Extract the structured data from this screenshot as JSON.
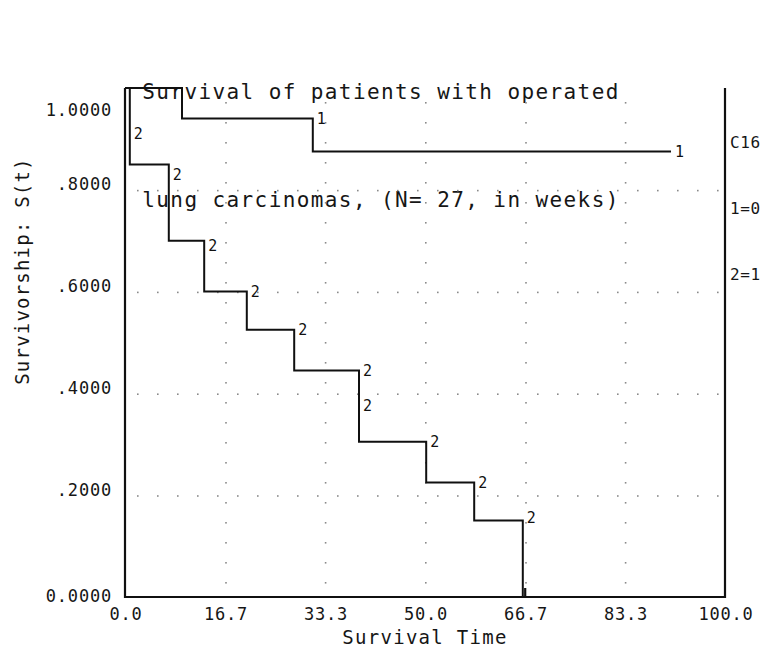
{
  "title": {
    "line1": "Survival of patients with operated",
    "line2": "lung carcinomas, (N= 27, in weeks)"
  },
  "axes": {
    "ylabel": "Survivorship: S(t)",
    "xlabel": "Survival Time",
    "yticks": [
      "1.0000",
      ".8000",
      ".6000",
      ".4000",
      ".2000",
      "0.0000"
    ],
    "xticks": [
      "0.0",
      "16.7",
      "33.3",
      "50.0",
      "66.7",
      "83.3",
      "100.0"
    ]
  },
  "legend": {
    "header": "C16",
    "entry1": "1=0",
    "entry2": "2=1"
  },
  "chart_data": {
    "type": "line",
    "title": "Survival of patients with operated lung carcinomas, (N= 27, in weeks)",
    "xlabel": "Survival Time",
    "ylabel": "Survivorship: S(t)",
    "xlim": [
      0.0,
      100.0
    ],
    "ylim": [
      0.0,
      1.0
    ],
    "xtick_values": [
      0.0,
      16.7,
      33.3,
      50.0,
      66.7,
      83.3,
      100.0
    ],
    "ytick_values": [
      1.0,
      0.8,
      0.6,
      0.4,
      0.2,
      0.0
    ],
    "grid": "dotted",
    "legend_position": "top-right-outside",
    "legend_title": "C16",
    "series": [
      {
        "name": "1=0",
        "marker": "1",
        "step": "post",
        "points": [
          {
            "x": 0.0,
            "y": 1.0
          },
          {
            "x": 9.5,
            "y": 1.0
          },
          {
            "x": 9.5,
            "y": 0.94
          },
          {
            "x": 31.3,
            "y": 0.94
          },
          {
            "x": 31.3,
            "y": 0.875
          },
          {
            "x": 91.0,
            "y": 0.875
          }
        ],
        "marker_points": [
          {
            "x": 31.3,
            "y": 0.94
          },
          {
            "x": 91.0,
            "y": 0.875
          }
        ]
      },
      {
        "name": "2=1",
        "marker": "2",
        "step": "post",
        "points": [
          {
            "x": 0.0,
            "y": 1.0
          },
          {
            "x": 0.8,
            "y": 1.0
          },
          {
            "x": 0.8,
            "y": 0.85
          },
          {
            "x": 7.3,
            "y": 0.85
          },
          {
            "x": 7.3,
            "y": 0.7
          },
          {
            "x": 13.2,
            "y": 0.7
          },
          {
            "x": 13.2,
            "y": 0.6
          },
          {
            "x": 20.3,
            "y": 0.6
          },
          {
            "x": 20.3,
            "y": 0.525
          },
          {
            "x": 28.2,
            "y": 0.525
          },
          {
            "x": 28.2,
            "y": 0.445
          },
          {
            "x": 39.0,
            "y": 0.445
          },
          {
            "x": 39.0,
            "y": 0.305
          },
          {
            "x": 50.2,
            "y": 0.305
          },
          {
            "x": 50.2,
            "y": 0.225
          },
          {
            "x": 58.2,
            "y": 0.225
          },
          {
            "x": 58.2,
            "y": 0.15
          },
          {
            "x": 66.3,
            "y": 0.15
          },
          {
            "x": 66.3,
            "y": 0.0
          }
        ],
        "marker_points": [
          {
            "x": 0.8,
            "y": 0.91
          },
          {
            "x": 7.3,
            "y": 0.83
          },
          {
            "x": 13.2,
            "y": 0.69
          },
          {
            "x": 20.3,
            "y": 0.6
          },
          {
            "x": 28.2,
            "y": 0.525
          },
          {
            "x": 39.0,
            "y": 0.445
          },
          {
            "x": 39.0,
            "y": 0.375
          },
          {
            "x": 50.2,
            "y": 0.305
          },
          {
            "x": 58.2,
            "y": 0.225
          },
          {
            "x": 66.3,
            "y": 0.155
          }
        ]
      }
    ]
  }
}
